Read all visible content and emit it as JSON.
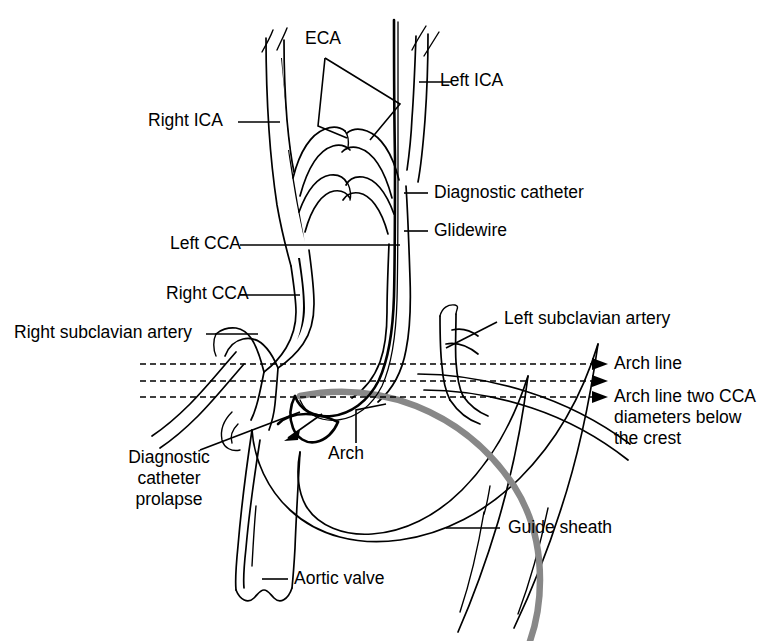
{
  "figure": {
    "background_color": "#ffffff",
    "line_color": "#000000",
    "sheath_color": "#888888"
  },
  "labels": {
    "eca": "ECA",
    "left_ica": "Left ICA",
    "right_ica": "Right ICA",
    "diagnostic_catheter": "Diagnostic catheter",
    "glidewire": "Glidewire",
    "left_cca": "Left CCA",
    "right_cca": "Right CCA",
    "right_subclavian": "Right subclavian artery",
    "left_subclavian": "Left subclavian artery",
    "arch_line": "Arch line",
    "arch_line_two_cca": "Arch line two CCA diameters below the crest",
    "diagnostic_catheter_prolapse": "Diagnostic\ncatheter\nprolapse",
    "arch": "Arch",
    "guide_sheath": "Guide sheath",
    "aortic_valve": "Aortic valve"
  },
  "label_lines": {
    "prolapse_line1": "Diagnostic",
    "prolapse_line2": "catheter",
    "prolapse_line3": "prolapse",
    "arch_two_line1": "Arch line two CCA",
    "arch_two_line2": "diameters below",
    "arch_two_line3": "the crest"
  },
  "annotations": {
    "dashed_line_count": 3,
    "arrow_count": 3
  }
}
